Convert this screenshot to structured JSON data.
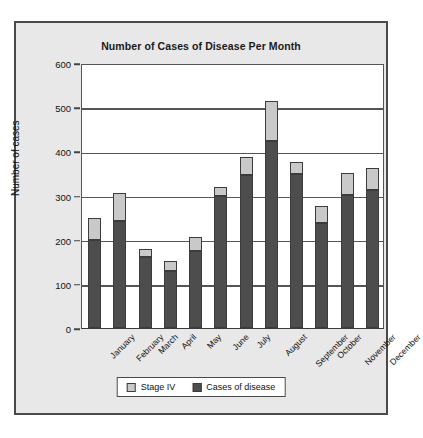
{
  "chart_data": {
    "type": "bar",
    "subtype": "stacked-vertical",
    "title": "Number of Cases of Disease Per Month",
    "xlabel": "",
    "ylabel": "Number of cases",
    "ylim": [
      0,
      600
    ],
    "ytick_step": 100,
    "yticks": [
      "0",
      "100",
      "200",
      "300",
      "400",
      "500",
      "600"
    ],
    "grid": "horizontal",
    "legend_position": "bottom-center",
    "categories": [
      "January",
      "February",
      "March",
      "April",
      "May",
      "June",
      "July",
      "August",
      "September",
      "October",
      "November",
      "December"
    ],
    "series": [
      {
        "name": "Cases of disease",
        "color": "#4d4d4d",
        "values": [
          200,
          242,
          160,
          130,
          175,
          300,
          347,
          423,
          348,
          238,
          301,
          312
        ]
      },
      {
        "name": "Stage IV",
        "color": "#c9c9c9",
        "values": [
          50,
          63,
          18,
          22,
          30,
          20,
          40,
          92,
          27,
          38,
          50,
          50
        ]
      }
    ],
    "totals": [
      250,
      305,
      178,
      152,
      205,
      320,
      387,
      515,
      375,
      276,
      351,
      362
    ]
  },
  "legend": {
    "entries": [
      {
        "label": "Stage IV",
        "color": "#c9c9c9"
      },
      {
        "label": "Cases of disease",
        "color": "#4d4d4d"
      }
    ]
  },
  "colors": {
    "frame_background": "#e8e8e8",
    "frame_border": "#4a4a4a",
    "plot_background": "#ffffff",
    "axis": "#555555",
    "text": "#111111"
  }
}
